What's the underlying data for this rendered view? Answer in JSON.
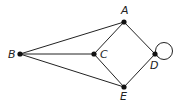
{
  "diagram": {
    "type": "graph",
    "nodes": [
      {
        "id": "A",
        "label": "A",
        "x": 124,
        "y": 22,
        "lx": 121,
        "ly": 14
      },
      {
        "id": "B",
        "label": "B",
        "x": 20,
        "y": 54,
        "lx": 8,
        "ly": 58
      },
      {
        "id": "C",
        "label": "C",
        "x": 94,
        "y": 54,
        "lx": 100,
        "ly": 58
      },
      {
        "id": "D",
        "label": "D",
        "x": 155,
        "y": 54,
        "lx": 150,
        "ly": 69
      },
      {
        "id": "E",
        "label": "E",
        "x": 124,
        "y": 87,
        "lx": 120,
        "ly": 100
      }
    ],
    "edges": [
      [
        "B",
        "A"
      ],
      [
        "B",
        "C"
      ],
      [
        "B",
        "E"
      ],
      [
        "C",
        "A"
      ],
      [
        "C",
        "E"
      ],
      [
        "A",
        "D"
      ],
      [
        "E",
        "D"
      ],
      [
        "D",
        "D"
      ]
    ],
    "loop": {
      "node": "D",
      "cx": 164,
      "cy": 51,
      "r": 8.5
    }
  }
}
